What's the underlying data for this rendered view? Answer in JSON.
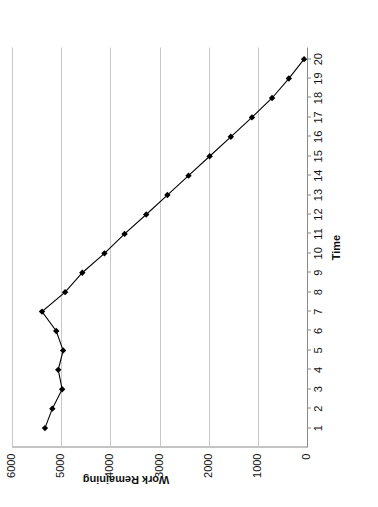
{
  "chart_data": {
    "type": "line",
    "title": "",
    "xlabel": "Time",
    "ylabel": "Work Remaining",
    "x": [
      1,
      2,
      3,
      4,
      5,
      6,
      7,
      8,
      9,
      10,
      11,
      12,
      13,
      14,
      15,
      16,
      17,
      18,
      19,
      20
    ],
    "xtick_labels": [
      "1",
      "2",
      "3",
      "4",
      "5",
      "6",
      "7",
      "8",
      "9",
      "10",
      "11",
      "12",
      "13",
      "14",
      "15",
      "16",
      "17",
      "18",
      "19",
      "20"
    ],
    "ytick_labels": [
      "0",
      "1000",
      "2000",
      "3000",
      "4000",
      "5000",
      "6000"
    ],
    "ytick_values": [
      0,
      1000,
      2000,
      3000,
      4000,
      5000,
      6000
    ],
    "xlim": [
      0,
      20.6
    ],
    "ylim": [
      0,
      6000
    ],
    "grid": "horizontal",
    "legend": "none",
    "marker": "filled-diamond",
    "series": [
      {
        "name": "Work Remaining",
        "color": "#000000",
        "values": [
          5330,
          5180,
          4980,
          5060,
          4960,
          5100,
          5390,
          4920,
          4570,
          4120,
          3710,
          3270,
          2840,
          2410,
          1980,
          1550,
          1120,
          710,
          370,
          60
        ]
      }
    ],
    "rotation_degrees": 90,
    "colors": {
      "line": "#000000",
      "marker": "#000000",
      "gridline": "#c8c8c8",
      "axis": "#8a8a8a",
      "background": "#ffffff",
      "text": "#111111"
    }
  }
}
